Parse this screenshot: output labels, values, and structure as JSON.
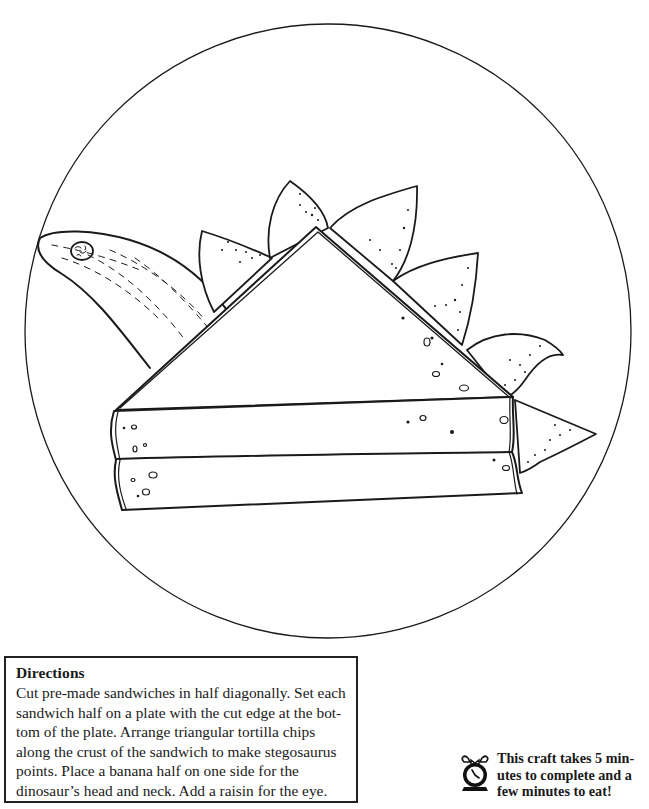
{
  "illustration": {
    "subject": "stegosaurus-sandwich-on-plate",
    "elements": [
      "plate",
      "sandwich-half",
      "banana-head-neck",
      "raisin-eye",
      "tortilla-chip-plates"
    ],
    "chip_count": 6,
    "line_color": "#1a1a1a",
    "background_color": "#ffffff"
  },
  "directions": {
    "title": "Directions",
    "lines": [
      "Cut pre-made sandwiches in half diagonally. Set each",
      "sandwich half on a plate with the cut edge at the bot-",
      "tom of the plate. Arrange triangular tortilla chips",
      "along the crust of the sandwich to make stegosaurus",
      "points. Place a banana half on one side for the",
      "dinosaur’s head and neck. Add a raisin for the eye."
    ]
  },
  "time_note": {
    "icon": "alarm-clock-icon",
    "lines": [
      "This craft takes 5 min-",
      "utes to complete and a",
      "few minutes to eat!"
    ]
  }
}
